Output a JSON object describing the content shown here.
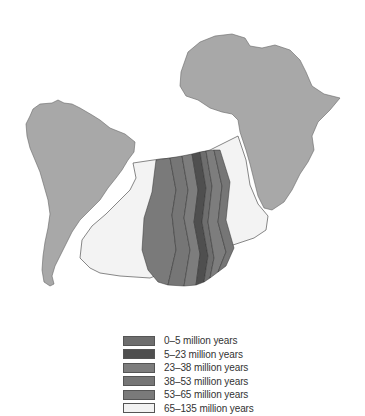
{
  "figure": {
    "type": "map",
    "landmasses": [
      {
        "name": "South America",
        "color": "#a8a8a8"
      },
      {
        "name": "Africa",
        "color": "#a8a8a8"
      }
    ],
    "ocean_region_color": "#f3f3f3"
  },
  "legend": {
    "items": [
      {
        "label": "0–5 million years",
        "color": "#6e6e6e"
      },
      {
        "label": "5–23 million years",
        "color": "#4f4f4f"
      },
      {
        "label": "23–38 million years",
        "color": "#7d7d7d"
      },
      {
        "label": "38–53 million years",
        "color": "#767676"
      },
      {
        "label": "53–65 million years",
        "color": "#7a7a7a"
      },
      {
        "label": "65–135 million years",
        "color": "#f2f2f2"
      }
    ]
  }
}
